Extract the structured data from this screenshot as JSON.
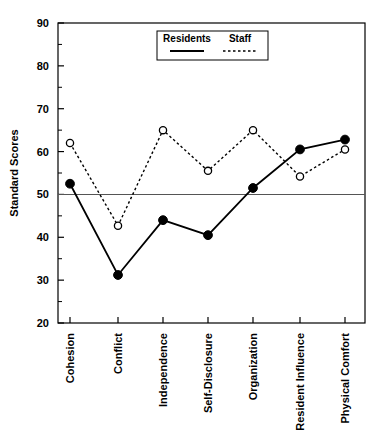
{
  "chart_data": {
    "type": "line",
    "title": "",
    "xlabel": "",
    "ylabel": "Standard Scores",
    "ylim": [
      20,
      90
    ],
    "ytick_step": 10,
    "yticks": [
      20,
      30,
      40,
      50,
      60,
      70,
      80,
      90
    ],
    "ytick_labels": [
      "20",
      "30",
      "40",
      "50",
      "60",
      "70",
      "80",
      "90"
    ],
    "minor_tick_step": 5,
    "grid": false,
    "reference_line": 50,
    "legend_position": "top-center",
    "categories": [
      "Cohesion",
      "Conflict",
      "Independence",
      "Self-Disclosure",
      "Organization",
      "Resident Influence",
      "Physical Comfort"
    ],
    "series": [
      {
        "name": "Residents",
        "line_style": "solid",
        "marker": "filled-circle",
        "color": "#000000",
        "values": [
          52.5,
          31.2,
          44.0,
          40.5,
          51.5,
          60.5,
          62.8
        ]
      },
      {
        "name": "Staff",
        "line_style": "dotted",
        "marker": "open-circle",
        "color": "#000000",
        "values": [
          62.0,
          42.7,
          65.0,
          55.5,
          65.0,
          54.2,
          60.5
        ]
      }
    ]
  },
  "legend": {
    "entries": [
      {
        "label": "Residents",
        "style": "solid"
      },
      {
        "label": "Staff",
        "style": "dotted"
      }
    ]
  },
  "axis": {
    "y_title": "Standard Scores"
  }
}
